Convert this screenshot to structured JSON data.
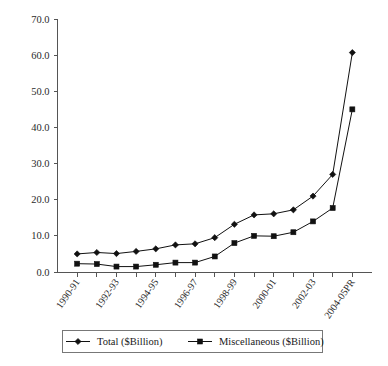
{
  "chart_data": {
    "type": "line",
    "title": "",
    "xlabel": "",
    "ylabel": "",
    "ylim": [
      0,
      70
    ],
    "ytick_step": 10,
    "grid": false,
    "legend_position": "bottom",
    "ytick_labels": [
      "0.0",
      "10.0",
      "20.0",
      "30.0",
      "40.0",
      "50.0",
      "60.0",
      "70.0"
    ],
    "ytick_values": [
      0,
      10,
      20,
      30,
      40,
      50,
      60,
      70
    ],
    "categories": [
      "1990-91",
      "1991-92",
      "1992-93",
      "1993-94",
      "1994-95",
      "1995-96",
      "1996-97",
      "1997-98",
      "1998-99",
      "1999-00",
      "2000-01",
      "2001-02",
      "2002-03",
      "2003-04",
      "2004-05PR"
    ],
    "xtick_labels_shown": [
      "1990-91",
      "1992-93",
      "1994-95",
      "1996-97",
      "1998-99",
      "2000-01",
      "2002-03",
      "2004-05PR"
    ],
    "series": [
      {
        "name": "Total ($Billion)",
        "marker": "diamond",
        "color": "#111111",
        "values": [
          5.0,
          5.4,
          5.1,
          5.7,
          6.4,
          7.5,
          7.8,
          9.5,
          13.2,
          15.8,
          16.1,
          17.2,
          21.0,
          27.0,
          60.7
        ]
      },
      {
        "name": "Miscellaneous ($Billion)",
        "marker": "square",
        "color": "#111111",
        "values": [
          2.3,
          2.2,
          1.5,
          1.5,
          2.0,
          2.6,
          2.6,
          4.3,
          8.0,
          10.0,
          9.9,
          11.0,
          14.0,
          17.7,
          45.0
        ]
      }
    ]
  },
  "legend": {
    "entries": [
      {
        "label": "Total ($Billion)",
        "marker": "diamond"
      },
      {
        "label": "Miscellaneous ($Billion)",
        "marker": "square"
      }
    ]
  }
}
